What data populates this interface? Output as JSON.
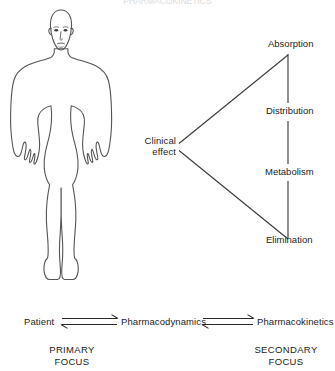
{
  "title": {
    "text": "PHARMACOKINETICS",
    "visible": "partially-cropped-at-top-edge"
  },
  "figure": {
    "name": "human-body-outline",
    "stroke_color": "#555555"
  },
  "diagram": {
    "center_node": {
      "line1": "Clinical",
      "line2": "effect"
    },
    "stages": [
      {
        "label": "Absorption"
      },
      {
        "label": "Distribution"
      },
      {
        "label": "Metabolism"
      },
      {
        "label": "Elimination"
      }
    ],
    "stroke_color": "#3c3c3c"
  },
  "bottom_flow": {
    "nodes": [
      {
        "label": "Patient"
      },
      {
        "label": "Pharmacodynamics"
      },
      {
        "label": "Pharmacokinetics"
      }
    ],
    "arrow_type": "equilibrium-double-arrow",
    "arrow_count": 2,
    "focus_labels": [
      {
        "line1": "PRIMARY",
        "line2": "FOCUS"
      },
      {
        "line1": "SECONDARY",
        "line2": "FOCUS"
      }
    ]
  },
  "colors": {
    "background": "#ffffff",
    "ink": "#1c1c1c",
    "line": "#3c3c3c",
    "figure_line": "#555555"
  }
}
